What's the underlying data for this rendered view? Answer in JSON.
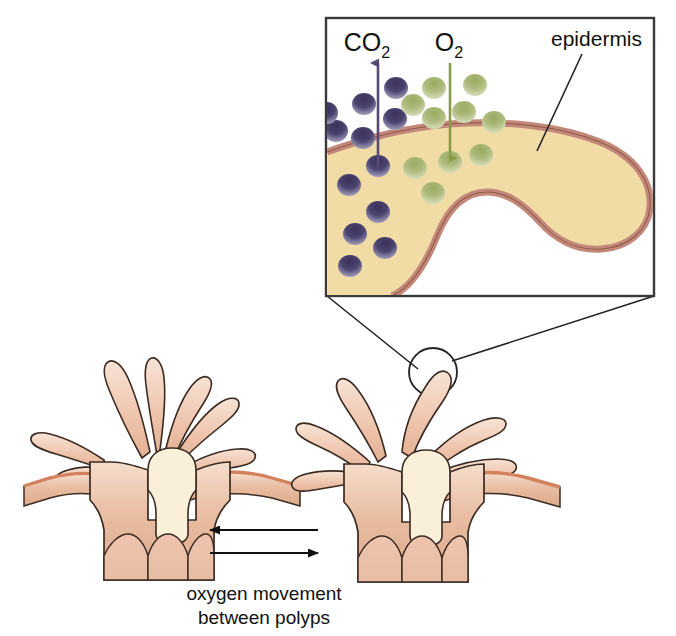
{
  "figure": {
    "background_color": "#ffffff"
  },
  "inset": {
    "name": "epidermis-gas-exchange-inset",
    "border_color": "#3a3a3a",
    "tissue_fill": "#f2dca6",
    "membrane_color": "#c4887a",
    "labels": {
      "co2": "CO",
      "co2_sub": "2",
      "o2": "O",
      "o2_sub": "2",
      "epidermis": "epidermis"
    },
    "arrows": [
      {
        "name": "co2-arrow",
        "label": "CO2",
        "direction": "up",
        "color": "#574a78",
        "meaning": "carbon dioxide diffuses out of the tissue"
      },
      {
        "name": "o2-arrow",
        "label": "O2",
        "direction": "down",
        "color": "#8a9c4a",
        "meaning": "oxygen diffuses into the tissue"
      }
    ],
    "particles": {
      "co2": {
        "color": "#4b4470",
        "color_light": "#b9b6cf",
        "count_outside": 6,
        "count_inside": 6
      },
      "o2": {
        "color": "#a7b873",
        "color_light": "#dfe6c4",
        "count_outside": 6,
        "count_inside": 4
      }
    }
  },
  "polyps": {
    "name": "coral-polyp-colony",
    "count": 2,
    "tissue_color": "#e7b79a",
    "tissue_color_light": "#f3d6c3",
    "outline_color": "#3a2a22",
    "membrane_color": "#d2825f",
    "pharynx_color": "#faefd9",
    "left_polyp_label": "left-polyp",
    "right_polyp_label": "right-polyp"
  },
  "magnifier": {
    "name": "magnifier-circle",
    "stroke": "#222222",
    "target": "tentacle tip of right polyp"
  },
  "exchange_arrows": {
    "name": "oxygen-exchange-arrows",
    "color": "#111111",
    "items": [
      {
        "name": "arrow-left",
        "direction": "left"
      },
      {
        "name": "arrow-right",
        "direction": "right"
      }
    ]
  },
  "caption": {
    "line1": "oxygen movement",
    "line2": "between polyps"
  }
}
